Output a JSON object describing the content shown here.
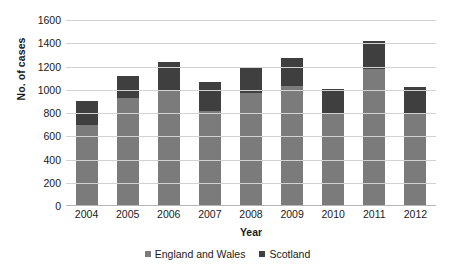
{
  "chart_data": {
    "type": "bar",
    "subtype": "stacked-column",
    "title": "",
    "xlabel": "Year",
    "ylabel": "No. of cases",
    "categories": [
      "2004",
      "2005",
      "2006",
      "2007",
      "2008",
      "2009",
      "2010",
      "2011",
      "2012"
    ],
    "series": [
      {
        "name": "England and Wales",
        "color": "#7b7b7b",
        "values": [
          700,
          930,
          1000,
          820,
          975,
          1035,
          800,
          1180,
          800
        ]
      },
      {
        "name": "Scotland",
        "color": "#3f3f3f",
        "values": [
          200,
          190,
          240,
          250,
          215,
          235,
          210,
          240,
          220
        ]
      }
    ],
    "totals": [
      900,
      1120,
      1240,
      1070,
      1190,
      1270,
      1010,
      1420,
      1020
    ],
    "ylim": [
      0,
      1600
    ],
    "ytick_values": [
      0,
      200,
      400,
      600,
      800,
      1000,
      1200,
      1400,
      1600
    ],
    "ytick_labels": [
      "0",
      "200",
      "400",
      "600",
      "800",
      "1000",
      "1200",
      "1400",
      "1600"
    ],
    "grid": true,
    "grid_axis": "y",
    "legend_position": "bottom",
    "legend_entries": [
      "England and Wales",
      "Scotland"
    ],
    "grid_color": "#d2d2d2",
    "background_color": "#ffffff"
  }
}
